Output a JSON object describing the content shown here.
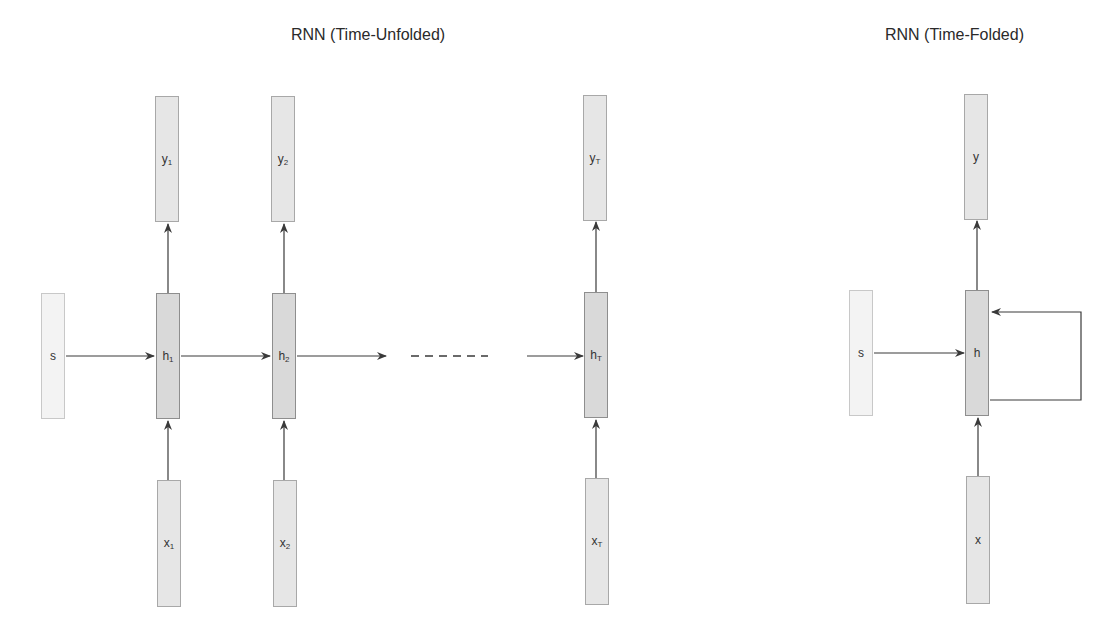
{
  "titles": {
    "unfolded": "RNN (Time-Unfolded)",
    "folded": "RNN (Time-Folded)"
  },
  "unfolded": {
    "state": {
      "label": "s"
    },
    "steps": [
      {
        "y": {
          "base": "y",
          "sub": "1"
        },
        "h": {
          "base": "h",
          "sub": "1"
        },
        "x": {
          "base": "x",
          "sub": "1"
        }
      },
      {
        "y": {
          "base": "y",
          "sub": "2"
        },
        "h": {
          "base": "h",
          "sub": "2"
        },
        "x": {
          "base": "x",
          "sub": "2"
        }
      },
      {
        "y": {
          "base": "y",
          "sub": "T"
        },
        "h": {
          "base": "h",
          "sub": "T"
        },
        "x": {
          "base": "x",
          "sub": "T"
        }
      }
    ],
    "ellipsis": "- - - - - -"
  },
  "folded": {
    "state": {
      "label": "s"
    },
    "y": {
      "label": "y"
    },
    "h": {
      "label": "h"
    },
    "x": {
      "label": "x"
    }
  },
  "colors": {
    "line": "#3a3a3a",
    "box_light": "#f3f3f3",
    "box_mid": "#e6e6e6",
    "box_dark": "#d9d9d9"
  }
}
